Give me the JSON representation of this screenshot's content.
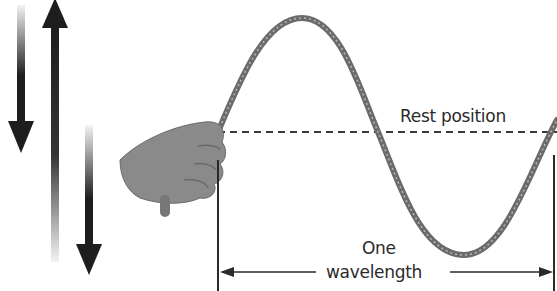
{
  "diagram": {
    "labels": {
      "rest_position": "Rest position",
      "wavelength_line1": "One",
      "wavelength_line2": "wavelength"
    },
    "elements": [
      "hand-holding-rope",
      "rope-wave",
      "rest-position-line",
      "wavelength-dimension",
      "motion-arrows"
    ],
    "colors": {
      "arrow": "#1e1e1e",
      "rope": "#6b6b6b",
      "hand": "#8a8a8a",
      "dashed_line": "#3a3a3a",
      "text": "#2a2a2a"
    }
  }
}
